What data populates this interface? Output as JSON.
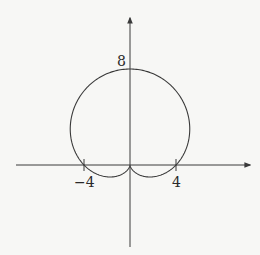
{
  "chart_data": {
    "type": "line",
    "title": "",
    "subtitle": "",
    "xlabel": "",
    "ylabel": "",
    "equation": "r = 4 + 4 sin(theta)",
    "curve_kind": "polar cardioid",
    "xlim": [
      -11,
      10
    ],
    "ylim": [
      -7,
      12
    ],
    "grid": false,
    "legend": null,
    "x_tick_labels": [
      "-4",
      "4"
    ],
    "x_ticks": [
      -4,
      4
    ],
    "y_tick_labels": [
      "8"
    ],
    "y_ticks": [
      8
    ],
    "key_points": [
      {
        "x": 0,
        "y": 8,
        "label": "8"
      },
      {
        "x": -4,
        "y": 0,
        "label": "-4"
      },
      {
        "x": 4,
        "y": 0,
        "label": "4"
      },
      {
        "x": 0,
        "y": 0,
        "label": "cusp"
      },
      {
        "x": 5.2,
        "y": 3,
        "label": "rightmost"
      },
      {
        "x": -5.2,
        "y": 3,
        "label": "leftmost"
      },
      {
        "x": 1.73,
        "y": -1,
        "label": "lowest right lobe"
      },
      {
        "x": -1.73,
        "y": -1,
        "label": "lowest left lobe"
      }
    ]
  },
  "labels": {
    "top": "8",
    "neg_x": "−4",
    "pos_x": "4"
  },
  "colors": {
    "curve": "#3a3a3a",
    "axis": "#3a3a3a",
    "background": "#f7f7f5"
  }
}
